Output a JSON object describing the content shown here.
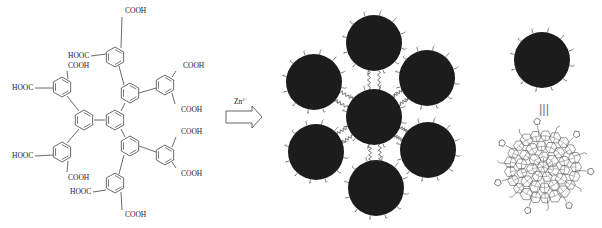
{
  "figure": {
    "molecule": {
      "name": "dendritic carboxylic acid ligand",
      "group_labels": {
        "cooh": "COOH",
        "hooc": "HOOC"
      }
    },
    "reaction": {
      "reagent": "Zn",
      "reagent_charge": "2+"
    },
    "equivalence_symbol": "|||",
    "colors": {
      "particle_fill": "#1c1c1c",
      "line": "#444444",
      "background": "#ffffff"
    }
  }
}
